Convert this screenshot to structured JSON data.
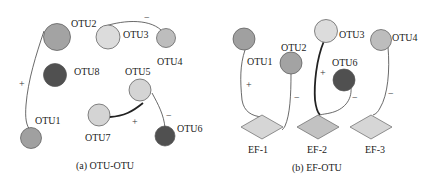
{
  "panel_a": {
    "caption": "(a)  OTU-OTU",
    "nodes": [
      {
        "id": "OTU1",
        "label": "OTU1",
        "color": "#a0a0a0"
      },
      {
        "id": "OTU2",
        "label": "OTU2",
        "color": "#a3a3a3"
      },
      {
        "id": "OTU3",
        "label": "OTU3",
        "color": "#dcdcdc"
      },
      {
        "id": "OTU4",
        "label": "OTU4",
        "color": "#bdbdbd"
      },
      {
        "id": "OTU5",
        "label": "OTU5",
        "color": "#d4d4d4"
      },
      {
        "id": "OTU6",
        "label": "OTU6",
        "color": "#505050"
      },
      {
        "id": "OTU7",
        "label": "OTU7",
        "color": "#d4d4d4"
      },
      {
        "id": "OTU8",
        "label": "OTU8",
        "color": "#505050"
      }
    ],
    "edges": [
      {
        "from": "OTU1",
        "to": "OTU2",
        "sign": "+"
      },
      {
        "from": "OTU3",
        "to": "OTU4",
        "sign": "−"
      },
      {
        "from": "OTU5",
        "to": "OTU7",
        "sign": "+"
      },
      {
        "from": "OTU5",
        "to": "OTU6",
        "sign": "−"
      }
    ]
  },
  "panel_b": {
    "caption": "(b)  EF-OTU",
    "nodes": [
      {
        "id": "OTU1",
        "label": "OTU1",
        "color": "#a0a0a0"
      },
      {
        "id": "OTU2",
        "label": "OTU2",
        "color": "#a3a3a3"
      },
      {
        "id": "OTU3",
        "label": "OTU3",
        "color": "#dcdcdc"
      },
      {
        "id": "OTU4",
        "label": "OTU4",
        "color": "#bdbdbd"
      },
      {
        "id": "OTU6",
        "label": "OTU6",
        "color": "#505050"
      }
    ],
    "factors": [
      {
        "id": "EF-1",
        "label": "EF-1",
        "color": "#d6d6d6"
      },
      {
        "id": "EF-2",
        "label": "EF-2",
        "color": "#c2c2c2"
      },
      {
        "id": "EF-3",
        "label": "EF-3",
        "color": "#d6d6d6"
      }
    ],
    "edges": [
      {
        "from": "EF-1",
        "to": "OTU1",
        "sign": "+"
      },
      {
        "from": "EF-1",
        "to": "OTU2",
        "sign": "−"
      },
      {
        "from": "EF-2",
        "to": "OTU3",
        "sign": "+"
      },
      {
        "from": "EF-2",
        "to": "OTU6",
        "sign": "−"
      },
      {
        "from": "EF-3",
        "to": "OTU4",
        "sign": "−"
      }
    ]
  }
}
